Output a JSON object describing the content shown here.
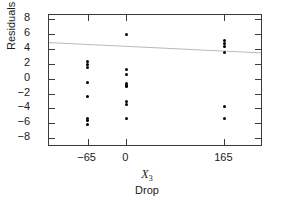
{
  "chart_data": {
    "type": "scatter",
    "title": "",
    "xlabel": "X_3 Drop",
    "xlabel_variable": "X",
    "xlabel_subscript": "3",
    "xlabel_name": "Drop",
    "ylabel": "Residuals",
    "xlim": [
      -130,
      230
    ],
    "ylim": [
      -9.2,
      8.6
    ],
    "xticks": [
      -65,
      0,
      165
    ],
    "xticklabels": [
      "−65",
      "0",
      "165"
    ],
    "yticks": [
      -8,
      -6,
      -4,
      -2,
      0,
      2,
      4,
      6,
      8
    ],
    "yticklabels": [
      "−8",
      "−6",
      "−4",
      "−2",
      "0",
      "2",
      "4",
      "6",
      "8"
    ],
    "grid": false,
    "legend": null,
    "frame": true,
    "marker": "filled-circle",
    "marker_color": "#000000",
    "series": [
      {
        "name": "Residuals vs Drop",
        "points": [
          {
            "x": -65,
            "y": 2.3
          },
          {
            "x": -65,
            "y": 1.9
          },
          {
            "x": -65,
            "y": 1.5
          },
          {
            "x": -65,
            "y": -0.5
          },
          {
            "x": -65,
            "y": -2.4
          },
          {
            "x": -65,
            "y": -5.3
          },
          {
            "x": -65,
            "y": -5.6
          },
          {
            "x": -65,
            "y": -6.1
          },
          {
            "x": 0,
            "y": 6.0
          },
          {
            "x": 0,
            "y": 1.3
          },
          {
            "x": 0,
            "y": 0.6
          },
          {
            "x": 0,
            "y": -0.6
          },
          {
            "x": 0,
            "y": -0.9
          },
          {
            "x": 0,
            "y": -1.1
          },
          {
            "x": 0,
            "y": -3.1
          },
          {
            "x": 0,
            "y": -3.5
          },
          {
            "x": 0,
            "y": -5.3
          },
          {
            "x": 165,
            "y": 5.1
          },
          {
            "x": 165,
            "y": 4.7
          },
          {
            "x": 165,
            "y": 4.4
          },
          {
            "x": 165,
            "y": 3.5
          },
          {
            "x": 165,
            "y": -3.8
          },
          {
            "x": 165,
            "y": -5.3
          }
        ]
      }
    ],
    "trendline": {
      "name": "fitted-line",
      "color": "#b0b0b0",
      "x_start": -130,
      "y_start": 4.75,
      "x_end": 230,
      "y_end": 3.35,
      "extends_beyond_frame": true
    }
  }
}
